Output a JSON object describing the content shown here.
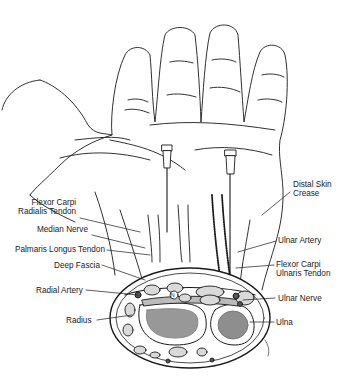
{
  "figure": {
    "labels_left": [
      {
        "id": "fcr",
        "text": "Flexor Carpi\nRadialis Tendon",
        "line1": "Flexor Carpi",
        "line2": "Radialis Tendon"
      },
      {
        "id": "median",
        "text": "Median Nerve"
      },
      {
        "id": "palmaris",
        "text": "Palmaris Longus Tendon"
      },
      {
        "id": "fascia",
        "text": "Deep Fascia"
      },
      {
        "id": "radial_artery",
        "text": "Radial Artery"
      },
      {
        "id": "radius",
        "text": "Radius"
      }
    ],
    "labels_right": [
      {
        "id": "crease",
        "line1": "Distal Skin",
        "line2": "Crease"
      },
      {
        "id": "ulnar_artery",
        "text": "Ulnar Artery"
      },
      {
        "id": "fcu",
        "line1": "Flexor Carpi",
        "line2": "Ulnaris Tendon"
      },
      {
        "id": "ulnar_nerve",
        "text": "Ulnar Nerve"
      },
      {
        "id": "ulna",
        "text": "Ulna"
      }
    ],
    "cross_section_marker": "N",
    "colors": {
      "ink": "#1a1a1a",
      "tissue": "#d9d9d9",
      "bone": "#444444",
      "background": "#ffffff"
    }
  }
}
